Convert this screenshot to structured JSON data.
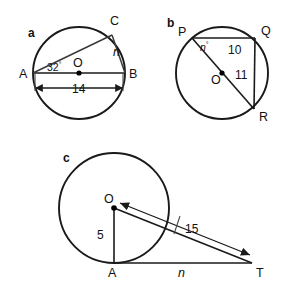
{
  "figure": {
    "background_color": "#ffffff",
    "stroke_color": "#1a1a1a",
    "panel_count": 3
  },
  "panels": [
    {
      "id": "a",
      "letter": "a",
      "shape": "circle-with-inscribed-right-triangle",
      "center_label": "O",
      "vertices": [
        {
          "name": "A",
          "label": "A"
        },
        {
          "name": "B",
          "label": "B"
        },
        {
          "name": "C",
          "label": "C"
        }
      ],
      "angle": {
        "value": "32",
        "degree_symbol": "°",
        "at_vertex": "A"
      },
      "measures": [
        {
          "name": "diameter-AB",
          "label": "14",
          "italic": false
        },
        {
          "name": "chord-CB",
          "label": "n",
          "italic": true
        }
      ]
    },
    {
      "id": "b",
      "letter": "b",
      "shape": "circle-with-inscribed-right-triangle",
      "center_label": "O",
      "vertices": [
        {
          "name": "P",
          "label": "P"
        },
        {
          "name": "Q",
          "label": "Q"
        },
        {
          "name": "R",
          "label": "R"
        }
      ],
      "angle": {
        "value": "n",
        "degree_symbol": "°",
        "at_vertex": "P",
        "italic": true
      },
      "measures": [
        {
          "name": "chord-PQ",
          "label": "10",
          "italic": false
        },
        {
          "name": "chord-QR",
          "label": "11",
          "italic": false
        }
      ]
    },
    {
      "id": "c",
      "letter": "c",
      "shape": "circle-with-external-tangent-triangle",
      "center_label": "O",
      "vertices": [
        {
          "name": "A",
          "label": "A"
        },
        {
          "name": "T",
          "label": "T"
        }
      ],
      "measures": [
        {
          "name": "radius-OA",
          "label": "5",
          "italic": false
        },
        {
          "name": "hypotenuse-OT",
          "label": "15",
          "italic": false
        },
        {
          "name": "tangent-AT",
          "label": "n",
          "italic": true
        }
      ]
    }
  ],
  "labels": {
    "panel_a_letter": "a",
    "panel_a_A": "A",
    "panel_a_B": "B",
    "panel_a_C": "C",
    "panel_a_O": "O",
    "panel_a_angle": "32",
    "panel_a_angle_deg": "°",
    "panel_a_diameter": "14",
    "panel_a_chord": "n",
    "panel_b_letter": "b",
    "panel_b_P": "P",
    "panel_b_Q": "Q",
    "panel_b_R": "R",
    "panel_b_O": "O",
    "panel_b_angle": "n",
    "panel_b_angle_deg": "°",
    "panel_b_chord_pq": "10",
    "panel_b_chord_qr": "11",
    "panel_c_letter": "c",
    "panel_c_O": "O",
    "panel_c_A": "A",
    "panel_c_T": "T",
    "panel_c_radius": "5",
    "panel_c_hypotenuse": "15",
    "panel_c_tangent": "n"
  }
}
